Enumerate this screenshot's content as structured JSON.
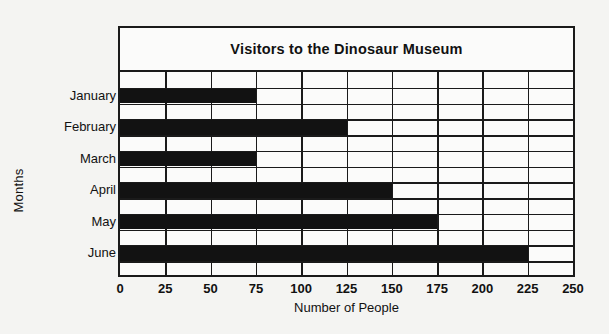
{
  "chart_data": {
    "type": "bar",
    "orientation": "horizontal",
    "title": "Visitors to the Dinosaur Museum",
    "xlabel": "Number of People",
    "ylabel": "Months",
    "categories": [
      "January",
      "February",
      "March",
      "April",
      "May",
      "June"
    ],
    "values": [
      75,
      125,
      75,
      150,
      175,
      225
    ],
    "xlim": [
      0,
      250
    ],
    "xticks": [
      0,
      25,
      50,
      75,
      100,
      125,
      150,
      175,
      200,
      225,
      250
    ],
    "xtick_labels": [
      "0",
      "25",
      "50",
      "75",
      "100",
      "125",
      "150",
      "175",
      "200",
      "225",
      "250"
    ],
    "grid": true,
    "legend": false,
    "bar_color": "#121212",
    "grid_color": "#1a1a1a",
    "plot_background": "#fbfbfa",
    "page_background": "#f4f4f2"
  }
}
